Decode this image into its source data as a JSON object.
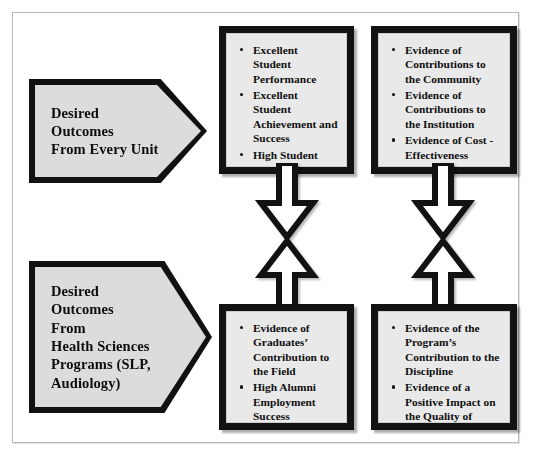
{
  "diagram": {
    "frame": {
      "border_color": "#b9b9b9",
      "background": "#ffffff"
    },
    "palette": {
      "shape_fill": "#d2d2d2",
      "box_fill": "#e9e9e9",
      "outline": "#121212",
      "text": "#0f0f0f"
    },
    "callouts": [
      {
        "id": "every-unit",
        "shape": "pentagon-arrow",
        "lines": [
          "Desired",
          "Outcomes",
          "From Every Unit"
        ]
      },
      {
        "id": "health-sciences",
        "shape": "pentagon-arrow",
        "lines": [
          "Desired",
          "Outcomes",
          "From",
          "Health Sciences",
          "Programs (SLP,",
          "Audiology)"
        ]
      }
    ],
    "boxes": [
      {
        "id": "student-outcomes",
        "position": "top-left",
        "bullets": [
          "Excellent Student Performance",
          "Excellent Student Achievement and Success",
          "High Student Satisfaction"
        ]
      },
      {
        "id": "institution-evidence",
        "position": "top-right",
        "bullets": [
          "Evidence of Contributions to the Community",
          "Evidence of Contributions to the Institution",
          "Evidence of Cost - Effectiveness"
        ]
      },
      {
        "id": "graduate-evidence",
        "position": "bottom-left",
        "bullets": [
          "Evidence of Graduates’ Contribution to the Field",
          "High Alumni Employment Success"
        ]
      },
      {
        "id": "program-evidence",
        "position": "bottom-right",
        "bullets": [
          "Evidence of the Program’s Contribution to the Discipline",
          "Evidence of a Positive Impact on the Quality of Health Services Provided"
        ]
      }
    ],
    "connectors": [
      {
        "id": "left-connector",
        "type": "double-headed-arrow",
        "direction": "vertical"
      },
      {
        "id": "right-connector",
        "type": "double-headed-arrow",
        "direction": "vertical"
      }
    ],
    "bleed_caption": ""
  }
}
